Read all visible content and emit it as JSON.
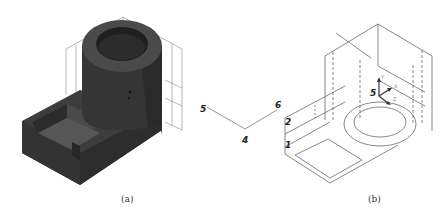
{
  "figure_a": {
    "caption": "(a)",
    "description": "shaded solid model: cylindrical boss with bore on L-shaped base with U-shaped pocket, with wireframe datum planes"
  },
  "figure_b": {
    "caption": "(b)",
    "description": "wireframe model with datum planes and coordinate system",
    "axis_labels": {
      "x": "X",
      "y": "Y",
      "z": "Z"
    }
  },
  "construction_lines": {
    "point_labels": [
      "5",
      "6",
      "4"
    ]
  },
  "model_b_labels": [
    "2",
    "1",
    "5"
  ],
  "colors": {
    "solid_fill": "#3a3a3a",
    "solid_dark": "#2a2a2a",
    "solid_light": "#505050",
    "line": "#555555"
  }
}
